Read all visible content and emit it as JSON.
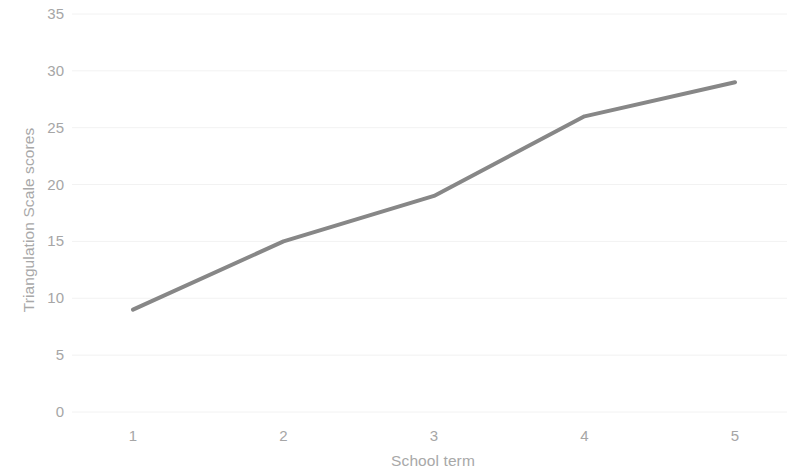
{
  "chart_data": {
    "type": "line",
    "title": "",
    "subtitle": "",
    "xlabel": "School term",
    "ylabel": "Triangulation Scale scores",
    "categories": [
      "1",
      "2",
      "3",
      "4",
      "5"
    ],
    "values": [
      9,
      15,
      19,
      26,
      29
    ],
    "series": [
      {
        "name": "Triangulation Scale scores",
        "values": [
          9,
          15,
          19,
          26,
          29
        ],
        "color": "#878787"
      }
    ],
    "ylim": [
      0,
      35
    ],
    "ytick_step": 5,
    "yticks": [
      "0",
      "5",
      "10",
      "15",
      "20",
      "25",
      "30",
      "35"
    ],
    "xticks": [
      "1",
      "2",
      "3",
      "4",
      "5"
    ],
    "grid": {
      "horizontal": true,
      "vertical": false,
      "color": "#f2f2f2"
    },
    "legend": {
      "visible": false,
      "position": "none"
    },
    "markers": false,
    "line_width": 4,
    "axis_line_visible": false,
    "colors": {
      "line": "#878787",
      "tick_label": "#a6a6a6",
      "axis_title": "#a8a8a8",
      "gridline": "#f2f2f2",
      "background": "#ffffff"
    }
  }
}
